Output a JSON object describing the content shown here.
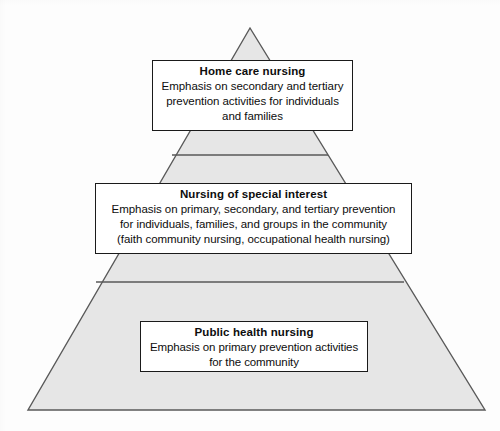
{
  "diagram": {
    "type": "pyramid",
    "shape_name": "three-tier-pyramid",
    "colors": {
      "pyramid_fill": "#e6e6e6",
      "pyramid_stroke": "#595959",
      "box_fill": "#ffffff",
      "box_stroke": "#1a1a1a",
      "text": "#0d0d0d",
      "background": "#fdfdfd"
    },
    "tiers": [
      {
        "id": "top",
        "title": "Home care nursing",
        "lines": [
          "Emphasis on secondary and tertiary",
          "prevention activities for individuals",
          "and families"
        ]
      },
      {
        "id": "middle",
        "title": "Nursing of special interest",
        "lines": [
          "Emphasis on primary, secondary, and tertiary prevention",
          "for individuals, families, and groups in the community",
          "(faith community nursing, occupational health nursing)"
        ]
      },
      {
        "id": "bottom",
        "title": "Public health nursing",
        "lines": [
          "Emphasis on primary prevention activities",
          "for the community"
        ]
      }
    ]
  }
}
